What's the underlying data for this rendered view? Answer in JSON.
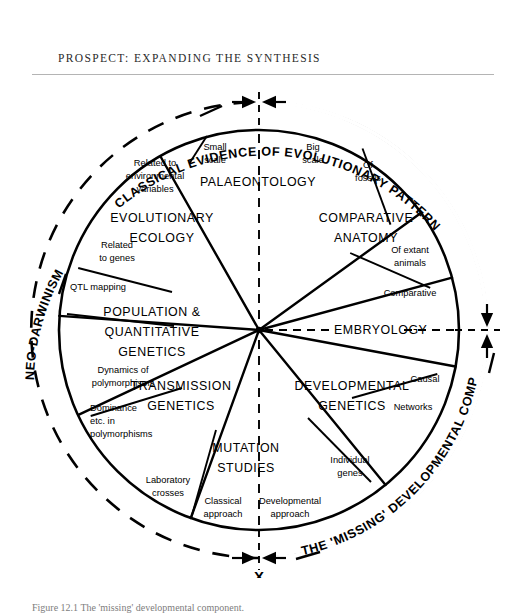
{
  "page": {
    "running_head": "PROSPECT: EXPANDING THE SYNTHESIS",
    "caption": "Figure 12.1  The 'missing' developmental component."
  },
  "diagram": {
    "type": "radial-sector-wheel",
    "center": {
      "x": 259,
      "y": 252
    },
    "radius_solid": 200,
    "radius_dashed": 228,
    "sectors": [
      {
        "id": "palaeontology",
        "label": "PALAEONTOLOGY",
        "sub_labels": [
          "Small scale",
          "Big scale"
        ]
      },
      {
        "id": "comparative-anatomy",
        "label": "COMPARATIVE ANATOMY",
        "sub_labels": [
          "Of fossils",
          "Of extant animals"
        ]
      },
      {
        "id": "embryology",
        "label": "EMBRYOLOGY",
        "sub_labels": [
          "Comparative"
        ]
      },
      {
        "id": "developmental-genetics",
        "label": "DEVELOPMENTAL GENETICS",
        "sub_labels": [
          "Causal",
          "Networks"
        ]
      },
      {
        "id": "mutation-studies",
        "label": "MUTATION STUDIES",
        "sub_labels": [
          "Individual genes",
          "Developmental approach"
        ]
      },
      {
        "id": "transmission-genetics",
        "label": "TRANSMISSION GENETICS",
        "sub_labels": [
          "Classical approach",
          "Laboratory crosses",
          "Dominance etc. in polymorphisms"
        ]
      },
      {
        "id": "population-quantitative-genetics",
        "label": "POPULATION & QUANTITATIVE GENETICS",
        "sub_labels": [
          "Dynamics of polymorphisms",
          "QTL mapping"
        ]
      },
      {
        "id": "evolutionary-ecology",
        "label": "EVOLUTIONARY ECOLOGY",
        "sub_labels": [
          "Related to genes",
          "Related to environmental variables"
        ]
      }
    ],
    "sector_labels": {
      "palaeontology_l1": "PALAEONTOLOGY",
      "comparative_anatomy_l1": "COMPARATIVE",
      "comparative_anatomy_l2": "ANATOMY",
      "embryology_l1": "EMBRYOLOGY",
      "developmental_genetics_l1": "DEVELOPMENTAL",
      "developmental_genetics_l2": "GENETICS",
      "mutation_studies_l1": "MUTATION",
      "mutation_studies_l2": "STUDIES",
      "transmission_genetics_l1": "TRANSMISSION",
      "transmission_genetics_l2": "GENETICS",
      "population_genetics_l1": "POPULATION &",
      "population_genetics_l2": "QUANTITATIVE",
      "population_genetics_l3": "GENETICS",
      "evolutionary_ecology_l1": "EVOLUTIONARY",
      "evolutionary_ecology_l2": "ECOLOGY"
    },
    "sub_labels": {
      "small_scale_l1": "Small",
      "small_scale_l2": "scale",
      "big_scale_l1": "Big",
      "big_scale_l2": "scale",
      "of_fossils_l1": "Of",
      "of_fossils_l2": "fossils",
      "of_extant_l1": "Of extant",
      "of_extant_l2": "animals",
      "comparative": "Comparative",
      "causal": "Causal",
      "networks": "Networks",
      "individual_genes_l1": "Individual",
      "individual_genes_l2": "genes",
      "developmental_approach_l1": "Developmental",
      "developmental_approach_l2": "approach",
      "classical_approach_l1": "Classical",
      "classical_approach_l2": "approach",
      "laboratory_crosses_l1": "Laboratory",
      "laboratory_crosses_l2": "crosses",
      "dominance_l1": "Dominance",
      "dominance_l2": "etc. in",
      "dominance_l3": "polymorphisms",
      "dynamics_l1": "Dynamics of",
      "dynamics_l2": "polymorphisms",
      "qtl_mapping": "QTL mapping",
      "related_genes_l1": "Related",
      "related_genes_l2": "to genes",
      "related_env_l1": "Related to",
      "related_env_l2": "environmental",
      "related_env_l3": "variables"
    },
    "arc_labels": {
      "classical_evidence": "CLASSICAL EVIDENCE OF EVOLUTIONARY PATTERN",
      "neo_darwinism": "NEO-DARWINISM",
      "missing_component": "THE 'MISSING' DEVELOPMENTAL COMPONENT"
    },
    "markers": {
      "x_label": "X"
    },
    "colors": {
      "ink": "#000000",
      "rule": "#b4b4b4",
      "caption": "#7d7d7d",
      "background": "#ffffff"
    }
  }
}
